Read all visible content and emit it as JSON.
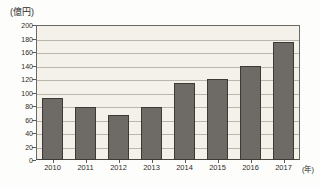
{
  "chart_data": {
    "type": "bar",
    "title": "",
    "subtitle": "",
    "xlabel": "(年)",
    "ylabel": "(億円)",
    "categories": [
      "2010",
      "2011",
      "2012",
      "2013",
      "2014",
      "2015",
      "2016",
      "2017"
    ],
    "values": [
      92,
      78,
      67,
      78,
      114,
      120,
      140,
      175
    ],
    "series": [
      {
        "name": "",
        "values": [
          92,
          78,
          67,
          78,
          114,
          120,
          140,
          175
        ]
      }
    ],
    "ylim": [
      0,
      200
    ],
    "ytick_step": 20,
    "yticks": [
      0,
      20,
      40,
      60,
      80,
      100,
      120,
      140,
      160,
      180,
      200
    ],
    "ytick_labels": [
      "0",
      "20",
      "40",
      "60",
      "80",
      "100",
      "120",
      "140",
      "160",
      "180",
      "200"
    ],
    "grid": true,
    "grid_axis": "y",
    "legend": false,
    "legend_position": "none",
    "annotations": [],
    "colors": {
      "bar_fill": "#6e6b66",
      "bar_border": "#3c3a36",
      "plot_background": "#f3f1e9",
      "gridline": "#b9b7ac",
      "axis": "#4a4a44",
      "text": "#2b2b2b",
      "page_background": "#fdfdfb"
    }
  }
}
